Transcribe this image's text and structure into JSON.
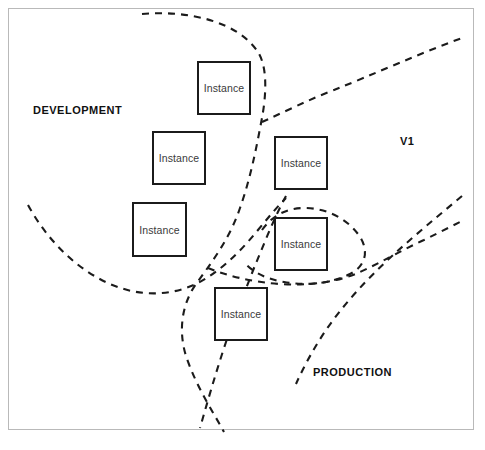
{
  "diagram": {
    "frame_color": "#b9b9b9",
    "boundary_color": "#1b1b1b",
    "box_border_color": "#1b1b1b",
    "background": "#ffffff",
    "zones": [
      {
        "name": "development-zone",
        "label": "DEVELOPMENT",
        "x": 33,
        "y": 104
      },
      {
        "name": "v1-zone",
        "label": "V1",
        "x": 400,
        "y": 135
      },
      {
        "name": "production-zone",
        "label": "PRODUCTION",
        "x": 313,
        "y": 366
      }
    ],
    "instances": [
      {
        "name": "instance-box-1",
        "label": "Instance",
        "x": 197,
        "y": 61,
        "w": 54,
        "h": 54
      },
      {
        "name": "instance-box-2",
        "label": "Instance",
        "x": 152,
        "y": 131,
        "w": 54,
        "h": 54
      },
      {
        "name": "instance-box-3",
        "label": "Instance",
        "x": 132,
        "y": 202,
        "w": 55,
        "h": 55
      },
      {
        "name": "instance-box-4",
        "label": "Instance",
        "x": 274,
        "y": 136,
        "w": 54,
        "h": 54
      },
      {
        "name": "instance-box-5",
        "label": "Instance",
        "x": 274,
        "y": 217,
        "w": 54,
        "h": 54
      },
      {
        "name": "instance-box-6",
        "label": "Instance",
        "x": 214,
        "y": 287,
        "w": 54,
        "h": 54
      }
    ],
    "boundaries": [
      {
        "name": "development-boundary",
        "path": "M 142 14 C 190 10 238 22 258 52 C 268 68 266 96 262 118 C 256 150 250 180 240 208 C 230 238 212 262 196 284 C 182 304 178 330 186 356 C 196 386 212 410 224 432"
      },
      {
        "name": "development-lower-boundary",
        "path": "M 28 205 C 46 238 74 268 110 284 C 140 297 170 296 196 284 C 220 272 240 252 258 230 C 268 218 276 208 286 198"
      },
      {
        "name": "v1-boundary",
        "path": "M 262 122 C 284 112 308 100 334 90 C 372 75 418 54 462 38"
      },
      {
        "name": "v1-lower-boundary",
        "path": "M 462 196 C 438 216 414 236 392 256 C 366 280 344 304 326 330 C 314 348 304 366 296 384"
      },
      {
        "name": "production-boundary",
        "path": "M 262 230 C 272 216 286 208 304 208 C 326 208 346 218 358 234 C 370 250 366 266 350 274 C 330 284 306 286 284 282 C 266 279 252 272 244 262"
      },
      {
        "name": "production-outer-boundary",
        "path": "M 208 268 C 228 276 252 282 280 284 C 310 286 338 282 360 272 C 382 262 402 250 424 240 C 440 232 452 226 464 220"
      },
      {
        "name": "production-left-boundary",
        "path": "M 286 196 C 274 218 264 244 254 268 C 244 294 234 318 226 342 C 216 372 208 400 200 428"
      }
    ],
    "caption": ""
  }
}
